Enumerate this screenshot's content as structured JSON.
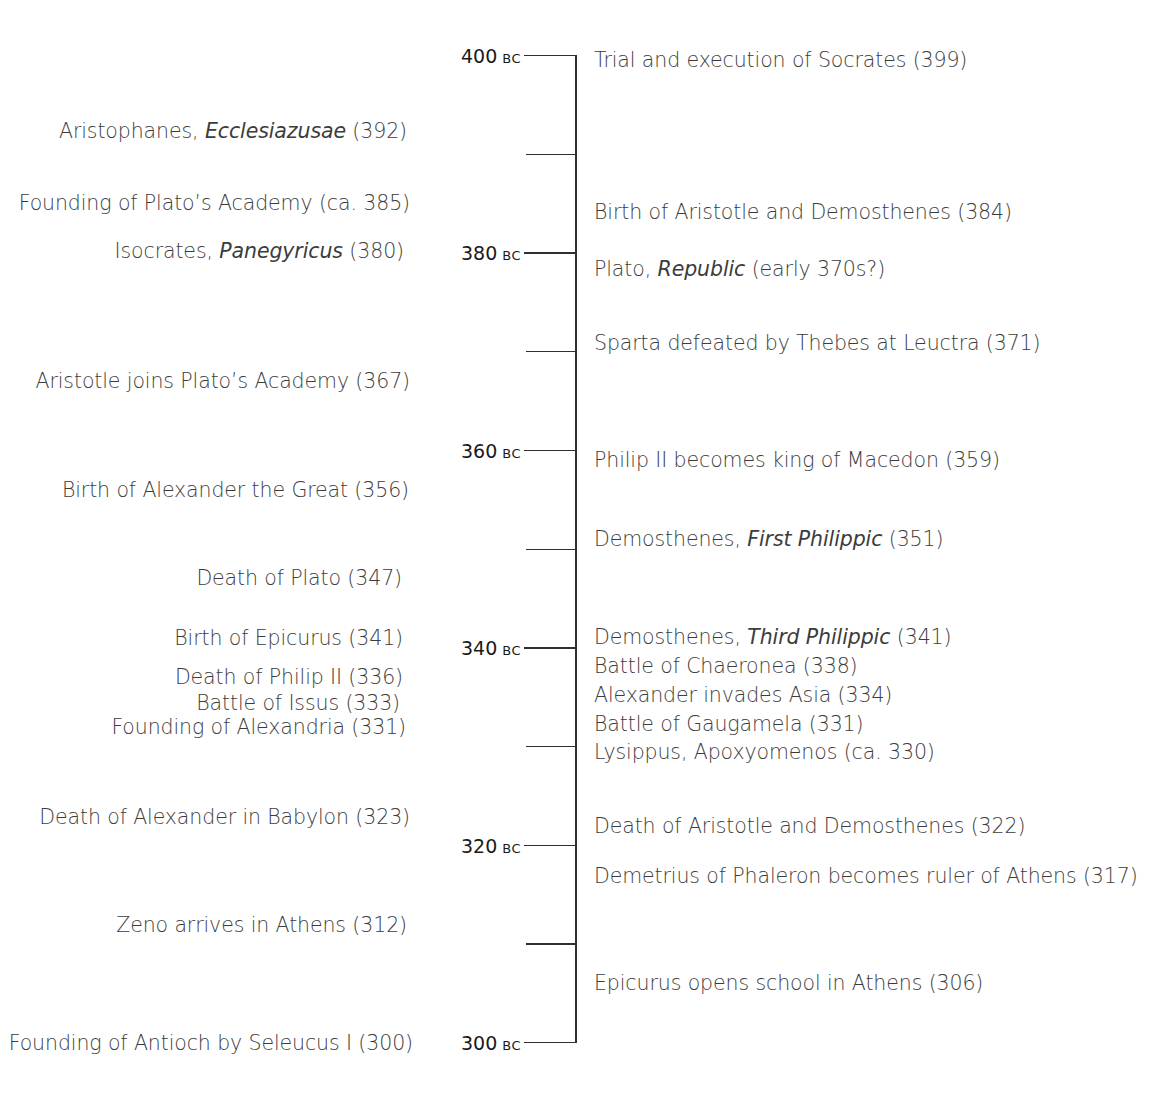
{
  "chart_data": {
    "type": "timeline",
    "orientation": "vertical",
    "range": [
      400,
      300
    ],
    "era": "BC",
    "major_ticks": [
      {
        "year": 400,
        "label": "400",
        "era": "BC"
      },
      {
        "year": 380,
        "label": "380",
        "era": "BC"
      },
      {
        "year": 360,
        "label": "360",
        "era": "BC"
      },
      {
        "year": 340,
        "label": "340",
        "era": "BC"
      },
      {
        "year": 320,
        "label": "320",
        "era": "BC"
      },
      {
        "year": 300,
        "label": "300",
        "era": "BC"
      }
    ],
    "minor_ticks": [
      390,
      370,
      350,
      330,
      310
    ],
    "left_events": [
      {
        "pre": "Aristophanes, ",
        "italic": "Ecclesiazusae",
        "post": " (392)",
        "year": 392
      },
      {
        "pre": "Founding of Plato’s Academy (ca. 385)",
        "italic": "",
        "post": "",
        "year": 385
      },
      {
        "pre": "Isocrates, ",
        "italic": "Panegyricus",
        "post": " (380)",
        "year": 380
      },
      {
        "pre": "Aristotle joins Plato’s Academy (367)",
        "italic": "",
        "post": "",
        "year": 367
      },
      {
        "pre": "Birth of Alexander the Great (356)",
        "italic": "",
        "post": "",
        "year": 356
      },
      {
        "pre": "Death of Plato (347)",
        "italic": "",
        "post": "",
        "year": 347
      },
      {
        "pre": "Birth of Epicurus (341)",
        "italic": "",
        "post": "",
        "year": 341
      },
      {
        "pre": "Death of Philip II (336)",
        "italic": "",
        "post": "",
        "year": 336
      },
      {
        "pre": "Battle of Issus (333)",
        "italic": "",
        "post": "",
        "year": 333
      },
      {
        "pre": "Founding of Alexandria (331)",
        "italic": "",
        "post": "",
        "year": 331
      },
      {
        "pre": "Death of Alexander in Babylon (323)",
        "italic": "",
        "post": "",
        "year": 323
      },
      {
        "pre": "Zeno arrives in Athens (312)",
        "italic": "",
        "post": "",
        "year": 312
      },
      {
        "pre": "Founding of Antioch by Seleucus I (300)",
        "italic": "",
        "post": "",
        "year": 300
      }
    ],
    "right_events": [
      {
        "pre": "Trial and execution of Socrates (399)",
        "italic": "",
        "post": "",
        "year": 399
      },
      {
        "pre": "Birth of Aristotle and Demosthenes (384)",
        "italic": "",
        "post": "",
        "year": 384
      },
      {
        "pre": "Plato, ",
        "italic": "Republic",
        "post": " (early 370s?)",
        "year": 378
      },
      {
        "pre": "Sparta defeated by Thebes at Leuctra (371)",
        "italic": "",
        "post": "",
        "year": 371
      },
      {
        "pre": "Philip II becomes king of Macedon (359)",
        "italic": "",
        "post": "",
        "year": 359
      },
      {
        "pre": "Demosthenes, ",
        "italic": "First Philippic",
        "post": " (351)",
        "year": 351
      },
      {
        "pre": "Demosthenes, ",
        "italic": "Third Philippic",
        "post": " (341)",
        "year": 341
      },
      {
        "pre": "Battle of Chaeronea (338)",
        "italic": "",
        "post": "",
        "year": 338
      },
      {
        "pre": "Alexander invades Asia (334)",
        "italic": "",
        "post": "",
        "year": 334
      },
      {
        "pre": "Battle of Gaugamela (331)",
        "italic": "",
        "post": "",
        "year": 331
      },
      {
        "pre": "Lysippus, Apoxyomenos (ca. 330)",
        "italic": "",
        "post": "",
        "year": 330
      },
      {
        "pre": "Death of Aristotle and Demosthenes (322)",
        "italic": "",
        "post": "",
        "year": 322
      },
      {
        "pre": "Demetrius of Phaleron becomes ruler of Athens (317)",
        "italic": "",
        "post": "",
        "year": 317
      },
      {
        "pre": "Epicurus opens school in Athens (306)",
        "italic": "",
        "post": "",
        "year": 306
      }
    ]
  },
  "layout": {
    "left_event_positions": [
      {
        "right": 748,
        "y": 131
      },
      {
        "right": 745,
        "y": 203
      },
      {
        "right": 751,
        "y": 251
      },
      {
        "right": 745,
        "y": 381
      },
      {
        "right": 746,
        "y": 490
      },
      {
        "right": 753,
        "y": 578
      },
      {
        "right": 752,
        "y": 638
      },
      {
        "right": 752,
        "y": 677
      },
      {
        "right": 755,
        "y": 703
      },
      {
        "right": 749,
        "y": 727
      },
      {
        "right": 745,
        "y": 817
      },
      {
        "right": 748,
        "y": 925
      },
      {
        "right": 742,
        "y": 1043
      }
    ],
    "right_event_positions": [
      {
        "left": 594,
        "y": 60
      },
      {
        "left": 594,
        "y": 212
      },
      {
        "left": 594,
        "y": 269
      },
      {
        "left": 594,
        "y": 343
      },
      {
        "left": 594,
        "y": 460
      },
      {
        "left": 594,
        "y": 539
      },
      {
        "left": 594,
        "y": 637
      },
      {
        "left": 594,
        "y": 666
      },
      {
        "left": 594,
        "y": 695
      },
      {
        "left": 594,
        "y": 724
      },
      {
        "left": 594,
        "y": 752
      },
      {
        "left": 594,
        "y": 826
      },
      {
        "left": 594,
        "y": 876
      },
      {
        "left": 594,
        "y": 983
      }
    ],
    "axis": {
      "top": 55,
      "bottom": 1042,
      "px_per_year": 9.855
    }
  },
  "colors": {
    "axis": "#2f2f2f",
    "tick_label": "#1a1a1a",
    "event_text": "#3c3c3c",
    "background": "#ffffff"
  }
}
